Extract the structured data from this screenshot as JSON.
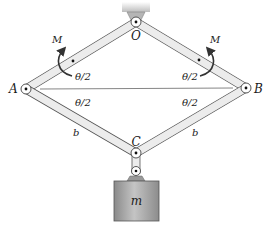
{
  "diagram": {
    "title": "",
    "labels": {
      "O": "O",
      "A": "A",
      "B": "B",
      "C": "C",
      "m": "m",
      "b_left": "b",
      "b_right": "b",
      "M_left": "M",
      "M_right": "M",
      "theta_upper_left": "θ/2",
      "theta_upper_right": "θ/2",
      "theta_lower_left": "θ/2",
      "theta_lower_right": "θ/2"
    },
    "nodes": [
      {
        "id": "O",
        "type": "pin-support",
        "x": 136,
        "y": 22
      },
      {
        "id": "A",
        "type": "pin",
        "x": 26,
        "y": 89
      },
      {
        "id": "B",
        "type": "pin",
        "x": 246,
        "y": 88
      },
      {
        "id": "C",
        "type": "pin",
        "x": 136,
        "y": 153
      },
      {
        "id": "hanger",
        "type": "pin",
        "x": 136,
        "y": 172
      }
    ],
    "edges": [
      {
        "from": "O",
        "to": "A",
        "type": "bar"
      },
      {
        "from": "O",
        "to": "B",
        "type": "bar"
      },
      {
        "from": "A",
        "to": "C",
        "type": "bar",
        "label": "b"
      },
      {
        "from": "B",
        "to": "C",
        "type": "bar",
        "label": "b"
      },
      {
        "from": "A",
        "to": "B",
        "type": "line"
      },
      {
        "from": "C",
        "to": "hanger",
        "type": "link"
      }
    ],
    "colors": {
      "bar_fill": "#ececec",
      "bar_stroke": "#555555",
      "mass_fill": "#a9a9a9",
      "support_fill": "#b5b5b5",
      "arrow": "#333333"
    }
  }
}
